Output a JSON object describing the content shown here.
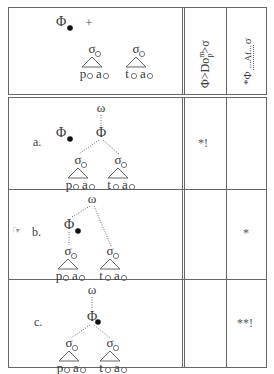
{
  "tableau": {
    "input": {
      "foot_symbol": "Φ",
      "plus": "+",
      "syllables": [
        {
          "node": "σ",
          "segments": [
            "p",
            "a"
          ]
        },
        {
          "node": "σ",
          "segments": [
            "t",
            "a"
          ]
        }
      ]
    },
    "constraints": [
      {
        "label": "Φ>Do",
        "sup": "m",
        "sub": "p",
        "tail": ">σ"
      },
      {
        "label": "*Φ",
        "mid": "Af",
        "tail": "σ"
      }
    ],
    "candidates": [
      {
        "label": "a.",
        "winner": false,
        "root": "ω",
        "foot": "Φ",
        "marks": [
          "*!",
          ""
        ]
      },
      {
        "label": "b.",
        "winner": true,
        "root": "ω",
        "foot": "Φ",
        "marks": [
          "",
          "*"
        ]
      },
      {
        "label": "c.",
        "winner": false,
        "root": "ω",
        "foot": "Φ",
        "marks": [
          "",
          "**!"
        ]
      }
    ],
    "winner_icon": "pointing-hand-icon",
    "winner_glyph": "☞",
    "colors": {
      "line": "#555555",
      "text": "#3a3a3a",
      "dot": "#111111"
    }
  }
}
